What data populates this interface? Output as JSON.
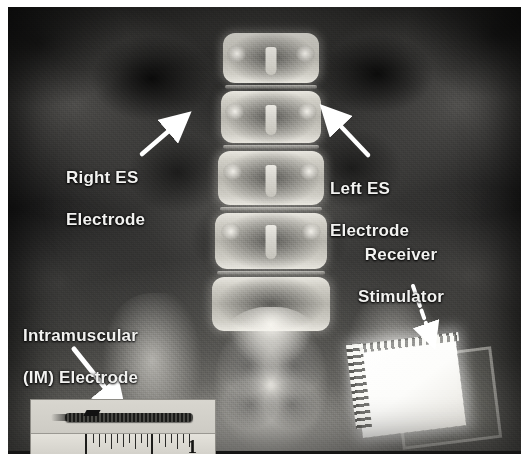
{
  "figure": {
    "type": "annotated-radiograph",
    "modality": "X-ray",
    "view": "lumbar spine anteroposterior",
    "annotations": [
      {
        "id": "right-es-electrode",
        "label": "Right ES\nElectrode",
        "line1": "Right ES",
        "line2": "Electrode",
        "arrow_style": "solid",
        "arrow_color": "#ffffff",
        "arrow_from": [
          137,
          142
        ],
        "arrow_to": [
          176,
          113
        ]
      },
      {
        "id": "left-es-electrode",
        "label": "Left ES\nElectrode",
        "line1": "Left ES",
        "line2": "Electrode",
        "arrow_style": "solid",
        "arrow_color": "#ffffff",
        "arrow_from": [
          357,
          146
        ],
        "arrow_to": [
          320,
          106
        ]
      },
      {
        "id": "receiver-stimulator",
        "label": "Receiver\nStimulator",
        "line1": "Receiver",
        "line2": "Stimulator",
        "arrow_style": "dashed",
        "arrow_color": "#ffffff",
        "arrow_from": [
          406,
          281
        ],
        "arrow_to": [
          424,
          336
        ]
      },
      {
        "id": "intramuscular-electrode",
        "label": "Intramuscular\n(IM) Electrode",
        "line1": "Intramuscular",
        "line2": "(IM) Electrode",
        "arrow_style": "solid",
        "arrow_color": "#ffffff",
        "arrow_from": [
          68,
          344
        ],
        "arrow_to": [
          112,
          402
        ]
      }
    ],
    "inset": {
      "id": "im-electrode-photo",
      "caption": "",
      "ruler_number": "1",
      "ruler_units": "inch",
      "subject": "intramuscular electrode"
    },
    "colors": {
      "label_text": "#f2f2f0",
      "arrow": "#ffffff",
      "plate_background": "#0b0b0b",
      "implant_bright": "#ffffff",
      "inset_background": "#d8d6cf"
    }
  }
}
